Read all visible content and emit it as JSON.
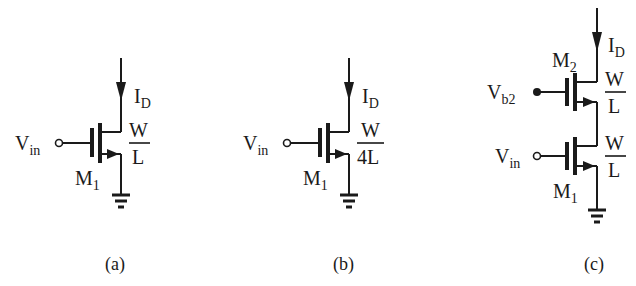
{
  "figure": {
    "panels": [
      {
        "id": "a",
        "caption": "(a)",
        "input_label": "V",
        "input_sub": "in",
        "transistor_label": "M",
        "transistor_sub": "1",
        "current_label": "I",
        "current_sub": "D",
        "ratio_num": "W",
        "ratio_den": "L"
      },
      {
        "id": "b",
        "caption": "(b)",
        "input_label": "V",
        "input_sub": "in",
        "transistor_label": "M",
        "transistor_sub": "1",
        "current_label": "I",
        "current_sub": "D",
        "ratio_num": "W",
        "ratio_den": "4L"
      },
      {
        "id": "c",
        "caption": "(c)",
        "bias_label": "V",
        "bias_sub": "b2",
        "input_label": "V",
        "input_sub": "in",
        "top_transistor_label": "M",
        "top_transistor_sub": "2",
        "bottom_transistor_label": "M",
        "bottom_transistor_sub": "1",
        "current_label": "I",
        "current_sub": "D",
        "top_ratio_num": "W",
        "top_ratio_den": "L",
        "bottom_ratio_num": "W",
        "bottom_ratio_den": "L"
      }
    ]
  }
}
